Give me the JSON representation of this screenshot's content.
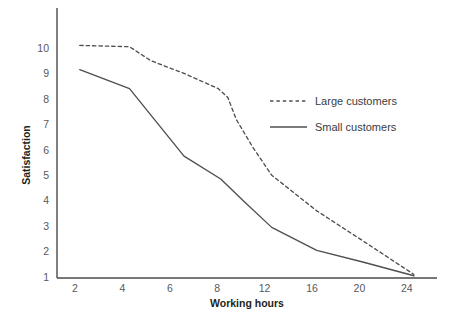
{
  "chart_data": {
    "type": "line",
    "title": "",
    "xlabel": "Working hours",
    "ylabel": "Satisfaction",
    "grid": false,
    "legend_position": "center-right",
    "x_ticks": [
      2,
      4,
      6,
      8,
      12,
      16,
      20,
      24
    ],
    "x_tick_labels": [
      "2",
      "4",
      "6",
      "8",
      "12",
      "16",
      "20",
      "24"
    ],
    "y_ticks": [
      1,
      2,
      3,
      4,
      5,
      6,
      7,
      8,
      9,
      10
    ],
    "y_tick_labels": [
      "1",
      "2",
      "3",
      "4",
      "5",
      "6",
      "7",
      "8",
      "9",
      "10"
    ],
    "ylim": [
      1,
      10.45
    ],
    "xlim_index": [
      -0.4,
      8.1
    ],
    "series": [
      {
        "name": "Large customers",
        "style": "dashed",
        "color": "#4f4f52",
        "points": [
          {
            "x": 2.2,
            "y": 10.1
          },
          {
            "x": 4.3,
            "y": 10.05
          },
          {
            "x": 5.2,
            "y": 9.5
          },
          {
            "x": 6.6,
            "y": 9.0
          },
          {
            "x": 8.1,
            "y": 8.4
          },
          {
            "x": 8.9,
            "y": 8.05
          },
          {
            "x": 9.6,
            "y": 7.2
          },
          {
            "x": 11.0,
            "y": 6.1
          },
          {
            "x": 12.6,
            "y": 5.0
          },
          {
            "x": 16.4,
            "y": 3.6
          },
          {
            "x": 20.2,
            "y": 2.45
          },
          {
            "x": 24.6,
            "y": 1.1
          }
        ]
      },
      {
        "name": "Small customers",
        "style": "solid",
        "color": "#4f4f52",
        "points": [
          {
            "x": 2.2,
            "y": 9.15
          },
          {
            "x": 4.3,
            "y": 8.4
          },
          {
            "x": 6.6,
            "y": 5.75
          },
          {
            "x": 8.3,
            "y": 4.85
          },
          {
            "x": 10.2,
            "y": 4.0
          },
          {
            "x": 12.6,
            "y": 2.95
          },
          {
            "x": 16.4,
            "y": 2.05
          },
          {
            "x": 20.2,
            "y": 1.6
          },
          {
            "x": 24.6,
            "y": 1.05
          }
        ]
      }
    ],
    "legend": [
      {
        "label": "Large customers",
        "style": "dashed"
      },
      {
        "label": "Small customers",
        "style": "solid"
      }
    ]
  }
}
